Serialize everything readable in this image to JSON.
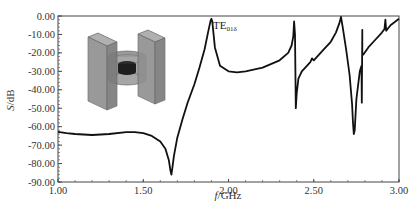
{
  "chart_data": {
    "type": "line",
    "title": "",
    "xlabel": "f/GHz",
    "xlabel_italic_part": "f",
    "xlabel_unit_part": "/GHz",
    "ylabel": "S/dB",
    "ylabel_italic_part": "S",
    "ylabel_unit_part": "/dB",
    "xlim": [
      1.0,
      3.0
    ],
    "ylim": [
      -90.0,
      0.0
    ],
    "xticks": [
      "1.00",
      "1.50",
      "2.00",
      "2.50",
      "3.00"
    ],
    "xtick_values": [
      1.0,
      1.5,
      2.0,
      2.5,
      3.0
    ],
    "yticks": [
      "0.00",
      "-10.00",
      "-20.00",
      "-30.00",
      "-40.00",
      "-50.00",
      "-60.00",
      "-70.00",
      "-80.00",
      "-90.00"
    ],
    "ytick_values": [
      0,
      -10,
      -20,
      -30,
      -40,
      -50,
      -60,
      -70,
      -80,
      -90
    ],
    "grid": false,
    "legend": null,
    "annotations": [
      {
        "text": "TE",
        "subscript": "01δ",
        "x": 1.91,
        "y": -4.5
      }
    ],
    "inset": "3D model of dielectric resonator between two rectangular metal blocks",
    "series": [
      {
        "name": "S",
        "color": "#111111",
        "x": [
          1.0,
          1.05,
          1.1,
          1.2,
          1.3,
          1.4,
          1.45,
          1.5,
          1.55,
          1.6,
          1.63,
          1.65,
          1.66,
          1.665,
          1.67,
          1.68,
          1.7,
          1.73,
          1.76,
          1.8,
          1.83,
          1.86,
          1.88,
          1.895,
          1.9,
          1.905,
          1.92,
          1.95,
          2.0,
          2.05,
          2.1,
          2.2,
          2.3,
          2.35,
          2.37,
          2.38,
          2.385,
          2.39,
          2.395,
          2.4,
          2.41,
          2.43,
          2.46,
          2.48,
          2.49,
          2.5,
          2.52,
          2.56,
          2.6,
          2.63,
          2.65,
          2.66,
          2.67,
          2.69,
          2.71,
          2.725,
          2.73,
          2.735,
          2.74,
          2.75,
          2.77,
          2.78,
          2.782,
          2.785,
          2.785,
          2.79,
          2.82,
          2.86,
          2.9,
          2.915,
          2.92,
          2.925,
          2.95,
          3.0
        ],
        "y": [
          -62.8,
          -63.5,
          -64.0,
          -64.5,
          -64.0,
          -63.0,
          -63.0,
          -63.5,
          -65.0,
          -68.0,
          -72.0,
          -78.0,
          -84.0,
          -86.0,
          -83.0,
          -76.0,
          -66.0,
          -56.0,
          -47.0,
          -37.0,
          -28.0,
          -18.0,
          -9.0,
          -2.5,
          -1.5,
          -3.0,
          -17.0,
          -27.0,
          -30.0,
          -30.5,
          -30.0,
          -28.0,
          -24.0,
          -20.0,
          -16.0,
          -11.0,
          -3.0,
          -10.0,
          -50.0,
          -42.0,
          -34.0,
          -30.0,
          -27.0,
          -25.0,
          -23.0,
          -24.0,
          -22.0,
          -18.0,
          -14.0,
          -9.0,
          -4.0,
          -0.5,
          -6.0,
          -18.0,
          -32.0,
          -48.0,
          -58.0,
          -64.0,
          -62.0,
          -45.0,
          -30.0,
          -27.0,
          -47.0,
          -7.5,
          -21.0,
          -21.0,
          -17.0,
          -13.0,
          -9.0,
          -7.0,
          -2.0,
          -8.0,
          -5.0,
          -1.5
        ]
      }
    ]
  }
}
